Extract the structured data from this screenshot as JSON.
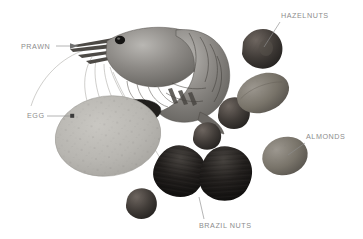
{
  "figure": {
    "background_color": "#ffffff",
    "label_color": "#8d8d8d",
    "leader_line_color": "#8d8d8d",
    "callouts": [
      {
        "id": "prawn",
        "label": "PRAWN",
        "icon": "prawn-icon",
        "label_x": 21,
        "label_y": 42,
        "leader": {
          "x1": 56,
          "y1": 46,
          "x2": 78,
          "y2": 46
        },
        "marker": "arrow"
      },
      {
        "id": "egg",
        "label": "EGG",
        "icon": "egg-icon",
        "label_x": 27,
        "label_y": 111,
        "leader": {
          "x1": 47,
          "y1": 116,
          "x2": 72,
          "y2": 116
        },
        "marker": "square"
      },
      {
        "id": "hazelnuts",
        "label": "HAZELNUTS",
        "icon": "hazelnut-icon",
        "label_x": 281,
        "label_y": 11,
        "leader": {
          "x1": 280,
          "y1": 22,
          "x2": 264,
          "y2": 47
        },
        "marker": "none"
      },
      {
        "id": "almonds",
        "label": "ALMONDS",
        "icon": "almond-icon",
        "label_x": 306,
        "label_y": 132,
        "leader": {
          "x1": 305,
          "y1": 143,
          "x2": 288,
          "y2": 155
        },
        "marker": "none"
      },
      {
        "id": "brazilnuts",
        "label": "BRAZIL NUTS",
        "icon": "brazil-nut-icon",
        "label_x": 199,
        "label_y": 221,
        "leader": {
          "x1": 204,
          "y1": 219,
          "x2": 199,
          "y2": 197
        },
        "marker": "none"
      }
    ],
    "specimens": [
      {
        "id": "prawn",
        "name": "prawn",
        "tone": "#7d7d7d"
      },
      {
        "id": "egg",
        "name": "egg",
        "tone": "#b6b4af"
      },
      {
        "id": "hazelnut-1",
        "name": "hazelnut-top",
        "tone": "#3a3733"
      },
      {
        "id": "hazelnut-2",
        "name": "hazelnut-mid",
        "tone": "#4a4641"
      },
      {
        "id": "hazelnut-3",
        "name": "hazelnut-small",
        "tone": "#3f3b37"
      },
      {
        "id": "hazelnut-4",
        "name": "hazelnut-bottom",
        "tone": "#403c38"
      },
      {
        "id": "almond-1",
        "name": "almond-large",
        "tone": "#6f6b64"
      },
      {
        "id": "almond-2",
        "name": "almond-right",
        "tone": "#7a756e"
      },
      {
        "id": "brazilnut-1",
        "name": "brazil-nut-left",
        "tone": "#262422"
      },
      {
        "id": "brazilnut-2",
        "name": "brazil-nut-right",
        "tone": "#1e1c1a"
      }
    ]
  }
}
